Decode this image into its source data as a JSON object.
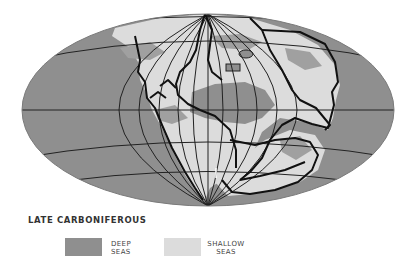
{
  "map": {
    "projection": "mollweide-like ellipse",
    "colors": {
      "deep_seas": "#8f8f8f",
      "shallow_seas": "#dcdcdc",
      "outline": "#111111",
      "graticule": "#222222"
    }
  },
  "legend": {
    "title": "LATE CARBONIFEROUS",
    "items": [
      {
        "line1": "DEEP",
        "line2": "SEAS",
        "color": "#8f8f8f"
      },
      {
        "line1": "SHALLOW",
        "line2": "SEAS",
        "color": "#dcdcdc"
      }
    ]
  }
}
